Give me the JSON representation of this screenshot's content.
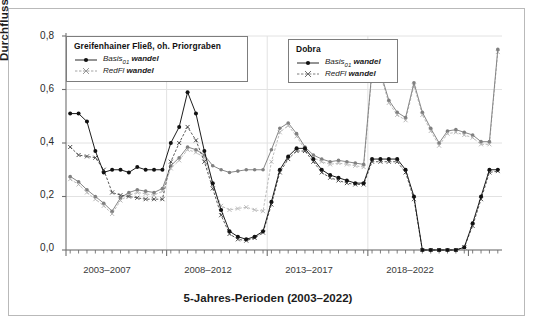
{
  "chart_data": {
    "type": "line",
    "title": "",
    "xlabel": "5-Jahres-Perioden (2003–2022)",
    "ylabel": "Durchfluss [m³/s]",
    "ylim": [
      0.0,
      0.8
    ],
    "yticks": [
      "0,0",
      "0,2",
      "0,4",
      "0,6",
      "0,8"
    ],
    "ytick_values": [
      0.0,
      0.2,
      0.4,
      0.6,
      0.8
    ],
    "xtick_labels": [
      "2003–2007",
      "2008–2012",
      "2013–2017",
      "2018–2022"
    ],
    "grid": true,
    "legend_position": "upper-left-and-upper-center",
    "n_points": 48,
    "series": [
      {
        "name": "Greifenhainer Fließ, oh. Priorgraben – Basis01 wandel",
        "station": "Greifenhainer Fließ, oh. Priorgraben",
        "scenario": "Basis01 wandel",
        "color": "#111111",
        "marker": "circle-filled",
        "linestyle": "solid",
        "values": [
          0.51,
          0.51,
          0.48,
          0.37,
          0.29,
          0.3,
          0.3,
          0.29,
          0.31,
          0.3,
          0.3,
          0.3,
          0.4,
          0.46,
          0.59,
          0.51,
          0.37,
          0.25,
          0.15,
          0.07,
          0.05,
          0.04,
          0.05,
          0.07,
          0.18,
          0.3,
          0.35,
          0.38,
          0.38,
          0.34,
          0.3,
          0.28,
          0.27,
          0.26,
          0.25,
          0.25,
          0.34,
          0.34,
          0.34,
          0.34,
          0.3,
          0.2,
          0.0,
          0.0,
          0.0,
          0.0,
          0.0,
          0.01,
          0.1,
          0.2,
          0.3,
          0.3
        ]
      },
      {
        "name": "Greifenhainer Fließ, oh. Priorgraben – RedFl wandel",
        "station": "Greifenhainer Fließ, oh. Priorgraben",
        "scenario": "RedFl wandel",
        "color": "#3c3c3c",
        "marker": "cross",
        "linestyle": "dashed",
        "values": [
          0.385,
          0.355,
          0.35,
          0.345,
          0.3,
          0.215,
          0.205,
          0.2,
          0.195,
          0.19,
          0.19,
          0.19,
          0.33,
          0.4,
          0.46,
          0.41,
          0.33,
          0.23,
          0.13,
          0.06,
          0.04,
          0.035,
          0.045,
          0.065,
          0.17,
          0.29,
          0.34,
          0.37,
          0.37,
          0.33,
          0.29,
          0.27,
          0.26,
          0.25,
          0.245,
          0.245,
          0.33,
          0.33,
          0.33,
          0.33,
          0.29,
          0.19,
          0.0,
          0.0,
          0.0,
          0.0,
          0.0,
          0.01,
          0.09,
          0.19,
          0.29,
          0.295
        ]
      },
      {
        "name": "Dobra – Basis01 wandel",
        "station": "Dobra",
        "scenario": "Basis01 wandel",
        "color": "#808080",
        "marker": "circle-filled",
        "linestyle": "solid",
        "values": [
          0.275,
          0.255,
          0.225,
          0.2,
          0.175,
          0.145,
          0.195,
          0.215,
          0.225,
          0.22,
          0.215,
          0.23,
          0.315,
          0.345,
          0.385,
          0.375,
          0.355,
          0.315,
          0.3,
          0.29,
          0.295,
          0.3,
          0.3,
          0.3,
          0.375,
          0.455,
          0.475,
          0.435,
          0.385,
          0.355,
          0.34,
          0.33,
          0.335,
          0.33,
          0.325,
          0.32,
          0.675,
          0.665,
          0.56,
          0.515,
          0.495,
          0.625,
          0.515,
          0.455,
          0.4,
          0.445,
          0.45,
          0.44,
          0.43,
          0.405,
          0.405,
          0.75
        ]
      },
      {
        "name": "Dobra – RedFl wandel",
        "station": "Dobra",
        "scenario": "RedFl wandel",
        "color": "#b0b0b0",
        "marker": "cross",
        "linestyle": "dashed",
        "values": [
          0.265,
          0.245,
          0.215,
          0.19,
          0.165,
          0.135,
          0.185,
          0.205,
          0.215,
          0.21,
          0.205,
          0.22,
          0.305,
          0.335,
          0.375,
          0.365,
          0.345,
          0.245,
          0.165,
          0.15,
          0.155,
          0.16,
          0.15,
          0.145,
          0.33,
          0.44,
          0.465,
          0.425,
          0.375,
          0.345,
          0.33,
          0.32,
          0.325,
          0.32,
          0.315,
          0.31,
          0.665,
          0.655,
          0.55,
          0.505,
          0.485,
          0.615,
          0.505,
          0.445,
          0.39,
          0.435,
          0.44,
          0.43,
          0.42,
          0.395,
          0.395,
          0.74
        ]
      }
    ]
  },
  "legends": [
    {
      "title": "Greifenhainer Fließ, oh. Priorgraben",
      "entries": [
        {
          "label_main": "Basis",
          "label_sub": "01",
          "label_tail": "wandel",
          "marker": "circle-filled",
          "linestyle": "solid",
          "color": "#111111"
        },
        {
          "label_main": "RedFl",
          "label_sub": "",
          "label_tail": "wandel",
          "marker": "cross",
          "linestyle": "dashed",
          "color": "#9a9a9a"
        }
      ]
    },
    {
      "title": "Dobra",
      "entries": [
        {
          "label_main": "Basis",
          "label_sub": "01",
          "label_tail": "wandel",
          "marker": "circle-filled",
          "linestyle": "solid",
          "color": "#111111"
        },
        {
          "label_main": "RedFl",
          "label_sub": "",
          "label_tail": "wandel",
          "marker": "cross",
          "linestyle": "dashed",
          "color": "#6e6e6e"
        }
      ]
    }
  ],
  "axes": {
    "y_title": "Durchfluss [m³/s]",
    "x_title": "5-Jahres-Perioden (2003–2022)",
    "y_ticks": [
      "0,8",
      "0,6",
      "0,4",
      "0,2",
      "0,0"
    ],
    "x_ticks": [
      "2003–2007",
      "2008–2012",
      "2013–2017",
      "2018–2022"
    ]
  },
  "colors": {
    "frame": "#b9b9b9",
    "axis": "#6f6f6f",
    "grid": "#e2e2e2",
    "background": "#ffffff"
  }
}
